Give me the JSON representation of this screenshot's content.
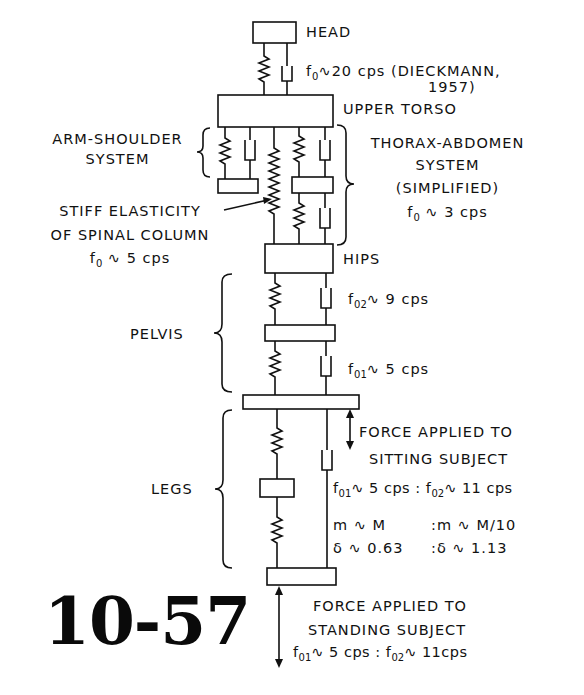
{
  "figure": {
    "number": "10-57",
    "type": "Mechanical lumped-parameter model of the human body (mass-spring-damper)"
  },
  "segments": {
    "head": {
      "label": "HEAD",
      "freq_var": "f",
      "freq_sub": "0",
      "freq_text": "∿20 cps (DIECKMANN,",
      "citation_year": "1957)"
    },
    "upper_torso": {
      "label": "UPPER TORSO"
    },
    "arm_shoulder": {
      "line1": "ARM-SHOULDER",
      "line2": "SYSTEM"
    },
    "thorax_abdomen": {
      "line1": "THORAX-ABDOMEN",
      "line2": "SYSTEM",
      "line3": "(SIMPLIFIED)",
      "freq_var": "f",
      "freq_sub": "0",
      "freq_text": " ∿ 3 cps"
    },
    "spinal": {
      "line1": "STIFF ELASTICITY",
      "line2": "OF SPINAL COLUMN",
      "freq_var": "f",
      "freq_sub": "0",
      "freq_text": " ∿ 5 cps"
    },
    "hips": {
      "label": "HIPS"
    },
    "pelvis": {
      "label": "PELVIS",
      "upper": {
        "freq_var": "f",
        "freq_sub": "02",
        "freq_text": "∿ 9 cps"
      },
      "lower": {
        "freq_var": "f",
        "freq_sub": "01",
        "freq_text": "∿ 5 cps"
      }
    },
    "legs": {
      "label": "LEGS"
    }
  },
  "sitting": {
    "line1": "FORCE APPLIED TO",
    "line2": "SITTING SUBJECT",
    "f1_var": "f",
    "f1_sub": "01",
    "f1_text": "∿ 5 cps",
    "sep": ":",
    "f2_var": "f",
    "f2_sub": "02",
    "f2_text": "∿ 11 cps",
    "mass_left": "m ∿ M",
    "mass_right": ":m ∿ M/10",
    "damp_left": "δ ∿ 0.63",
    "damp_right": ":δ ∿ 1.13"
  },
  "standing": {
    "line1": "FORCE APPLIED TO",
    "line2": "STANDING SUBJECT",
    "f1_var": "f",
    "f1_sub": "01",
    "f1_text": "∿ 5 cps",
    "sep": ":",
    "f2_var": "f",
    "f2_sub": "02",
    "f2_text": "∿ 11cps"
  },
  "colors": {
    "ink": "#111111",
    "background": "#ffffff"
  }
}
